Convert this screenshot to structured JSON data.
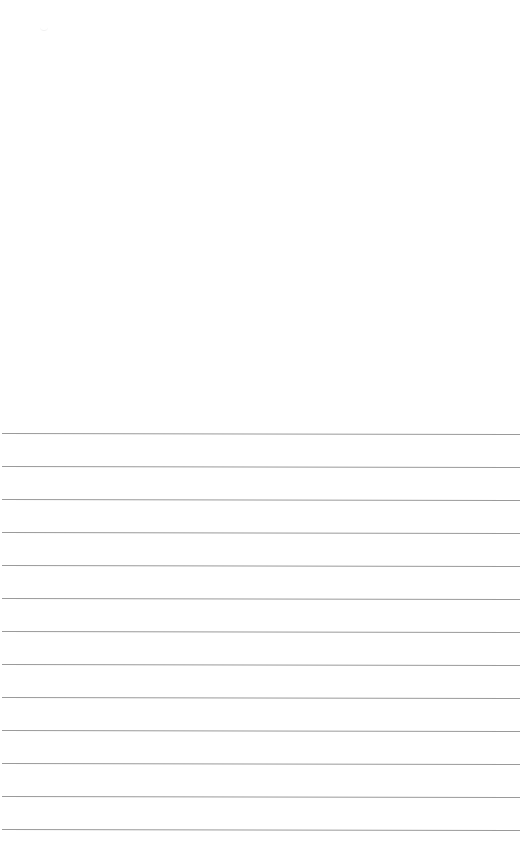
{
  "document": {
    "type": "lined-paper",
    "background_color": "#ffffff",
    "rule_color": "#9a9a9a",
    "rule_count": 13,
    "rules_top_y": [
      433,
      466,
      499,
      532,
      565,
      598,
      631,
      664,
      697,
      730,
      763,
      796,
      829
    ],
    "text": ""
  }
}
